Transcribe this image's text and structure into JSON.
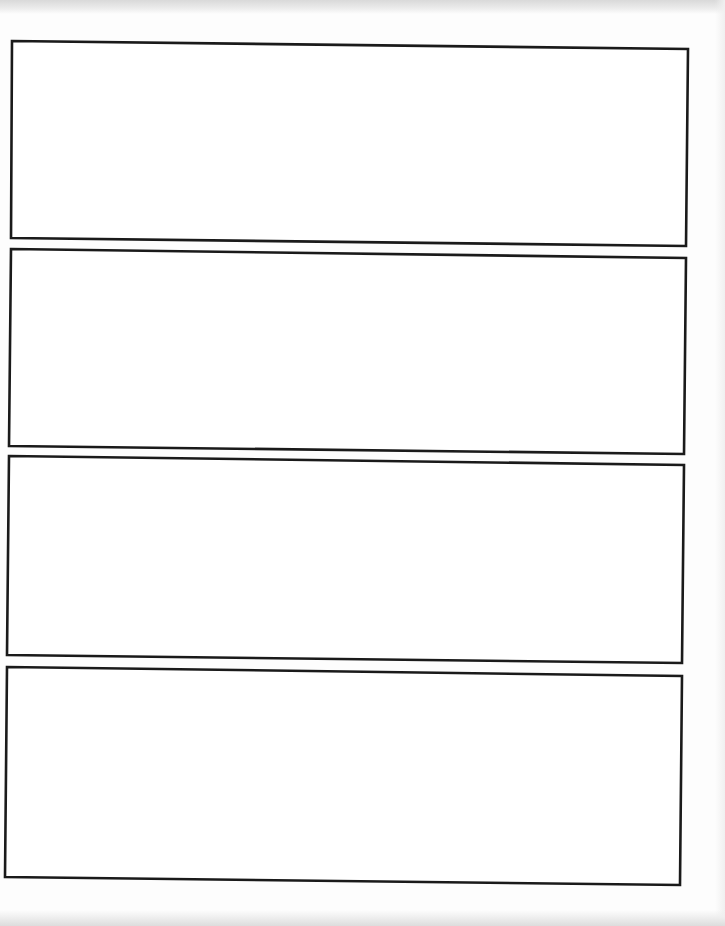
{
  "document": {
    "type": "blank panel template",
    "panel_count": 4,
    "border_color": "#1a1a1a",
    "background_color": "#ffffff",
    "panels": [
      {
        "index": 1,
        "points": "12,41 688,49 686,246 11,238",
        "content": ""
      },
      {
        "index": 2,
        "points": "11,249 686,258 684,454 9,446",
        "content": ""
      },
      {
        "index": 3,
        "points": "9,456 684,465 682,663 7,655",
        "content": ""
      },
      {
        "index": 4,
        "points": "7,667 682,676 680,885 5,877",
        "content": ""
      }
    ]
  }
}
